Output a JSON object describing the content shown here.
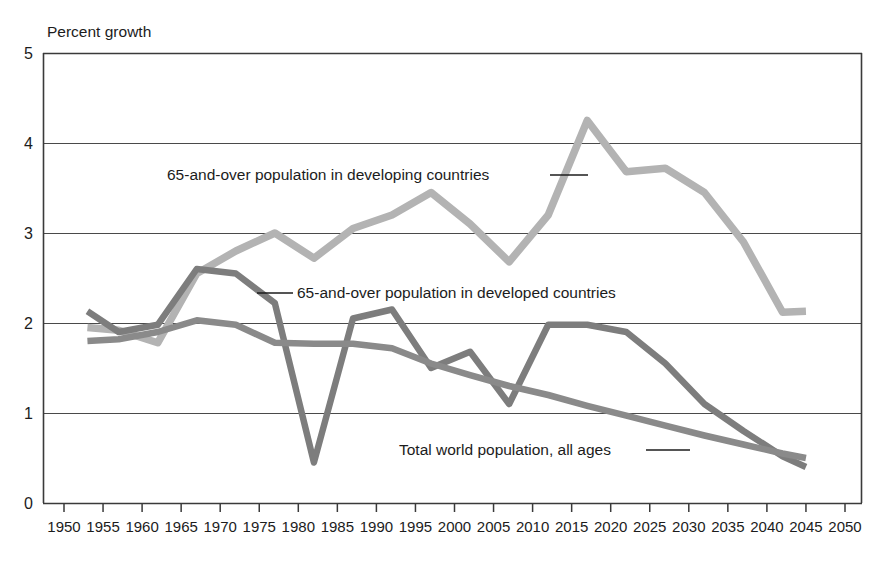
{
  "chart_data": {
    "type": "line",
    "title": "",
    "ylabel": "Percent growth",
    "xlabel": "",
    "ylim": [
      0,
      5
    ],
    "xlim": [
      1950,
      2050
    ],
    "yticks": [
      "0",
      "1",
      "2",
      "3",
      "4",
      "5"
    ],
    "xticks": [
      "1950",
      "1955",
      "1960",
      "1965",
      "1970",
      "1975",
      "1980",
      "1985",
      "1990",
      "1995",
      "2000",
      "2005",
      "2010",
      "2015",
      "2020",
      "2025",
      "2030",
      "2035",
      "2040",
      "2045",
      "2050"
    ],
    "grid": "horizontal",
    "legend_position": "inline-annotations",
    "series": [
      {
        "name": "65-and-over population in developing countries",
        "color": "#b3b3b3",
        "annotation": "65-and-over population in developing countries",
        "x": [
          1953,
          1957,
          1962,
          1967,
          1972,
          1977,
          1982,
          1987,
          1992,
          1997,
          2002,
          2007,
          2012,
          2017,
          2022,
          2027,
          2032,
          2037,
          2042,
          2045
        ],
        "values": [
          1.95,
          1.92,
          1.78,
          2.55,
          2.8,
          3.0,
          2.72,
          3.05,
          3.2,
          3.45,
          3.1,
          2.68,
          3.2,
          4.25,
          3.68,
          3.72,
          3.45,
          2.9,
          2.12,
          2.13
        ]
      },
      {
        "name": "65-and-over population in developed countries",
        "color": "#7d7d7d",
        "annotation": "65-and-over population in developed countries",
        "x": [
          1953,
          1957,
          1962,
          1967,
          1972,
          1977,
          1982,
          1987,
          1992,
          1997,
          2002,
          2007,
          2012,
          2017,
          2022,
          2027,
          2032,
          2037,
          2042,
          2045
        ],
        "values": [
          2.13,
          1.9,
          1.98,
          2.6,
          2.55,
          2.22,
          0.45,
          2.05,
          2.15,
          1.5,
          1.68,
          1.1,
          1.98,
          1.98,
          1.9,
          1.55,
          1.1,
          0.8,
          0.52,
          0.4
        ]
      },
      {
        "name": "Total world population, all ages",
        "color": "#8a8a8a",
        "annotation": "Total world population, all ages",
        "x": [
          1953,
          1957,
          1962,
          1967,
          1972,
          1977,
          1982,
          1987,
          1992,
          1997,
          2002,
          2007,
          2012,
          2017,
          2022,
          2027,
          2032,
          2037,
          2042,
          2045
        ],
        "values": [
          1.8,
          1.82,
          1.9,
          2.03,
          1.98,
          1.78,
          1.77,
          1.77,
          1.72,
          1.55,
          1.42,
          1.3,
          1.2,
          1.08,
          0.97,
          0.86,
          0.75,
          0.65,
          0.55,
          0.5
        ]
      }
    ]
  },
  "axis": {
    "y_title": "Percent growth"
  },
  "colors": {
    "developing": "#b3b3b3",
    "developed": "#7d7d7d",
    "world": "#8a8a8a",
    "frame": "#3a3a3a",
    "text": "#1c1c1c"
  }
}
